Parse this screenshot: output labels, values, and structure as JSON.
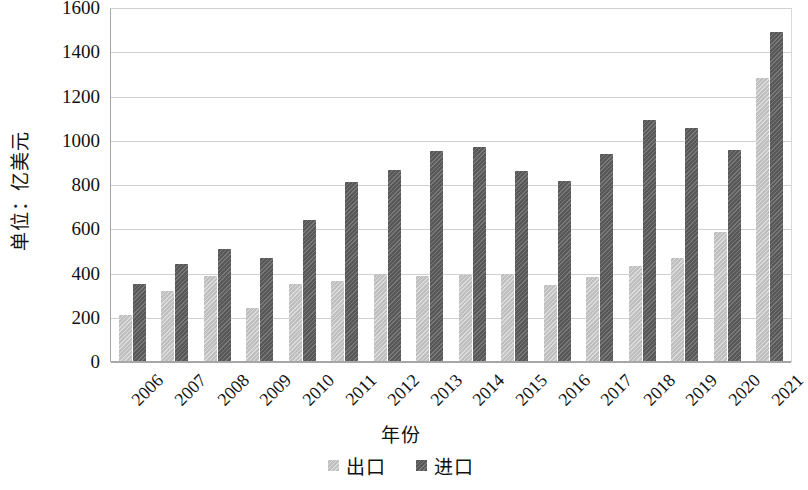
{
  "chart_data": {
    "type": "bar",
    "title": "",
    "xlabel": "年份",
    "ylabel": "单位：亿美元",
    "ylim": [
      0,
      1600
    ],
    "ytick_step": 200,
    "yticks": [
      1600,
      1400,
      1200,
      1000,
      800,
      600,
      400,
      200,
      0
    ],
    "grid": true,
    "legend_position": "bottom",
    "categories": [
      "2006",
      "2007",
      "2008",
      "2009",
      "2010",
      "2011",
      "2012",
      "2013",
      "2014",
      "2015",
      "2016",
      "2017",
      "2018",
      "2019",
      "2020",
      "2021"
    ],
    "series": [
      {
        "name": "出口",
        "color": "#bfbfbf",
        "values": [
          210,
          315,
          385,
          240,
          348,
          360,
          395,
          382,
          388,
          395,
          345,
          378,
          428,
          467,
          583,
          1280
        ]
      },
      {
        "name": "进口",
        "color": "#585858",
        "values": [
          348,
          437,
          507,
          465,
          637,
          807,
          862,
          947,
          967,
          857,
          812,
          935,
          1088,
          1055,
          952,
          1487
        ]
      }
    ]
  },
  "axis": {
    "y_title": "单位：亿美元",
    "x_title": "年份"
  },
  "legend": {
    "items": [
      {
        "label": "出口",
        "color": "#bfbfbf"
      },
      {
        "label": "进口",
        "color": "#585858"
      }
    ]
  },
  "colors": {
    "export_bar": "#bfbfbf",
    "import_bar": "#585858",
    "gridline": "#d0d0d0",
    "axis_line": "#a6a6a6",
    "text": "#111111",
    "background": "#ffffff"
  }
}
